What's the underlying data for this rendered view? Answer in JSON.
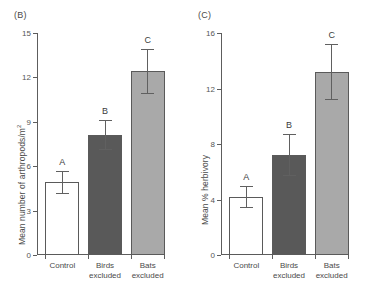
{
  "figure": {
    "background": "#ffffff",
    "axis_color": "#5d5d5d",
    "text_color": "#4a4a4a"
  },
  "panels": [
    {
      "id": "panel-b",
      "label": "(B)",
      "ylabel_main": "Mean number of arthropods/m",
      "ylabel_sup": "2",
      "colors": {
        "control": "#ffffff",
        "birds_excluded": "#595959",
        "bats_excluded": "#a9a9a9",
        "outline": "#5a5a5a"
      }
    },
    {
      "id": "panel-c",
      "label": "(C)",
      "ylabel_main": "Mean % herbivory",
      "ylabel_sup": "",
      "colors": {
        "control": "#ffffff",
        "birds_excluded": "#595959",
        "bats_excluded": "#a9a9a9",
        "outline": "#5a5a5a"
      }
    }
  ],
  "chart_data": [
    {
      "type": "bar",
      "panel": "(B)",
      "title": "",
      "xlabel": "",
      "ylabel": "Mean number of arthropods/m2",
      "categories": [
        "Control",
        "Birds excluded",
        "Bats excluded"
      ],
      "values": [
        4.9,
        8.1,
        12.4
      ],
      "errors": [
        0.75,
        1.0,
        1.5
      ],
      "annotations": [
        "A",
        "B",
        "C"
      ],
      "bar_colors": [
        "#ffffff",
        "#595959",
        "#a9a9a9"
      ],
      "ylim": [
        0,
        15
      ],
      "yticks": [
        0,
        3,
        6,
        9,
        12,
        15
      ],
      "ytick_labels": [
        "0",
        "3",
        "6",
        "9",
        "12",
        "15"
      ],
      "grid": false,
      "legend": "none"
    },
    {
      "type": "bar",
      "panel": "(C)",
      "title": "",
      "xlabel": "",
      "ylabel": "Mean % herbivory",
      "categories": [
        "Control",
        "Birds excluded",
        "Bats excluded"
      ],
      "values": [
        4.2,
        7.2,
        13.2
      ],
      "errors": [
        0.8,
        1.5,
        2.0
      ],
      "annotations": [
        "A",
        "B",
        "C"
      ],
      "bar_colors": [
        "#ffffff",
        "#595959",
        "#a9a9a9"
      ],
      "ylim": [
        0,
        16
      ],
      "yticks": [
        0,
        4,
        8,
        12,
        16
      ],
      "ytick_labels": [
        "0",
        "4",
        "8",
        "12",
        "16"
      ],
      "grid": false,
      "legend": "none"
    }
  ],
  "category_lines": [
    [
      "Control"
    ],
    [
      "Birds",
      "excluded"
    ],
    [
      "Bats",
      "excluded"
    ]
  ]
}
